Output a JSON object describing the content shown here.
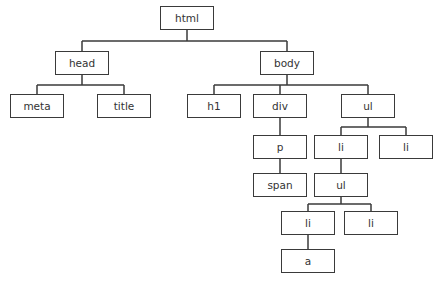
{
  "diagram": {
    "title": "",
    "type": "tree",
    "nodes": [
      {
        "id": "html",
        "label": "html",
        "x": 160,
        "y": 6,
        "w": 54,
        "h": 24
      },
      {
        "id": "head",
        "label": "head",
        "x": 55,
        "y": 51,
        "w": 54,
        "h": 24
      },
      {
        "id": "body",
        "label": "body",
        "x": 260,
        "y": 51,
        "w": 54,
        "h": 24
      },
      {
        "id": "meta",
        "label": "meta",
        "x": 10,
        "y": 94,
        "w": 54,
        "h": 24
      },
      {
        "id": "title",
        "label": "title",
        "x": 97,
        "y": 94,
        "w": 54,
        "h": 24
      },
      {
        "id": "h1",
        "label": "h1",
        "x": 187,
        "y": 94,
        "w": 54,
        "h": 24
      },
      {
        "id": "div",
        "label": "div",
        "x": 253,
        "y": 94,
        "w": 54,
        "h": 24
      },
      {
        "id": "ul1",
        "label": "ul",
        "x": 341,
        "y": 94,
        "w": 54,
        "h": 24
      },
      {
        "id": "p",
        "label": "p",
        "x": 253,
        "y": 135,
        "w": 54,
        "h": 24
      },
      {
        "id": "li1",
        "label": "li",
        "x": 314,
        "y": 135,
        "w": 54,
        "h": 24
      },
      {
        "id": "li2",
        "label": "li",
        "x": 379,
        "y": 135,
        "w": 54,
        "h": 24
      },
      {
        "id": "span",
        "label": "span",
        "x": 253,
        "y": 173,
        "w": 54,
        "h": 24
      },
      {
        "id": "ul2",
        "label": "ul",
        "x": 314,
        "y": 173,
        "w": 54,
        "h": 24
      },
      {
        "id": "li3",
        "label": "li",
        "x": 281,
        "y": 211,
        "w": 54,
        "h": 24
      },
      {
        "id": "li4",
        "label": "li",
        "x": 344,
        "y": 211,
        "w": 54,
        "h": 24
      },
      {
        "id": "a",
        "label": "a",
        "x": 281,
        "y": 249,
        "w": 54,
        "h": 24
      }
    ],
    "edges": [
      [
        "html",
        "head"
      ],
      [
        "html",
        "body"
      ],
      [
        "head",
        "meta"
      ],
      [
        "head",
        "title"
      ],
      [
        "body",
        "h1"
      ],
      [
        "body",
        "div"
      ],
      [
        "body",
        "ul1"
      ],
      [
        "div",
        "p"
      ],
      [
        "p",
        "span"
      ],
      [
        "ul1",
        "li1"
      ],
      [
        "ul1",
        "li2"
      ],
      [
        "li1",
        "ul2"
      ],
      [
        "ul2",
        "li3"
      ],
      [
        "ul2",
        "li4"
      ],
      [
        "li3",
        "a"
      ]
    ]
  }
}
